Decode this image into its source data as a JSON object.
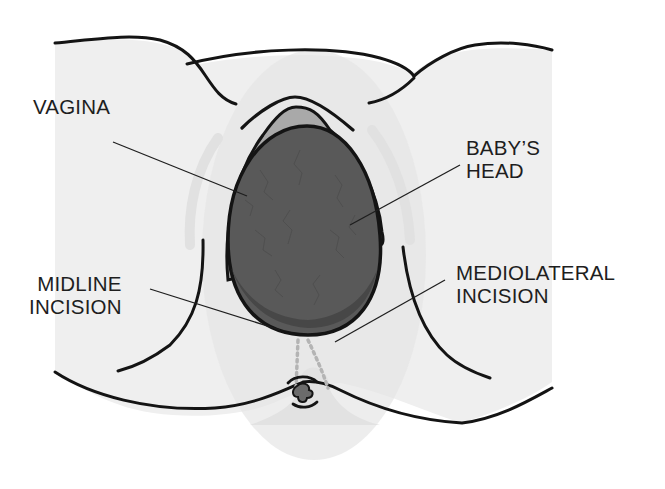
{
  "diagram": {
    "colors": {
      "background": "#ffffff",
      "skin": "#efefef",
      "skin_shadow": "#e4e4e4",
      "outline": "#141414",
      "vaginal_wall": "#a9a9a9",
      "head_fill": "#595959",
      "head_shadow": "#474747",
      "incision_dots": "#b4b4b4",
      "anus_fill": "#6b6b6b",
      "label_text": "#1e1e1e",
      "leader_line": "#1e1e1e"
    },
    "labels": [
      {
        "id": "vagina",
        "lines": [
          "VAGINA"
        ],
        "x": 33,
        "y": 117,
        "align": "left",
        "leader": {
          "x1": 113,
          "y1": 142,
          "x2": 247,
          "y2": 196
        }
      },
      {
        "id": "babys-head",
        "lines": [
          "BABY’S",
          "HEAD"
        ],
        "x": 466,
        "y": 136,
        "align": "left",
        "leader": {
          "x1": 460,
          "y1": 165,
          "x2": 350,
          "y2": 225
        }
      },
      {
        "id": "midline-incision",
        "lines": [
          "MIDLINE",
          "INCISION"
        ],
        "x": 29,
        "y": 272,
        "align": "right",
        "leader": {
          "x1": 150,
          "y1": 289,
          "x2": 280,
          "y2": 330
        }
      },
      {
        "id": "mediolateral-incision",
        "lines": [
          "MEDIOLATERAL",
          "INCISION"
        ],
        "x": 456,
        "y": 261,
        "align": "left",
        "leader": {
          "x1": 445,
          "y1": 280,
          "x2": 335,
          "y2": 342
        }
      }
    ]
  }
}
